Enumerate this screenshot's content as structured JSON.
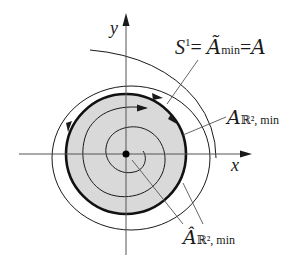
{
  "diagram": {
    "axes": {
      "x_label": "x",
      "y_label": "y"
    },
    "labels": {
      "circle_label": {
        "s": "S",
        "sup": "1",
        "eq1": "=",
        "a_tilde": "Ã",
        "min": "min",
        "eq2": "=",
        "a": "A"
      },
      "disk_label": {
        "a": "A",
        "sub": "ℝ², min"
      },
      "hat_label": {
        "a_hat": "Â",
        "sub": "ℝ², min"
      }
    },
    "colors": {
      "disk_fill": "#d9d9d9",
      "stroke": "#1a1a1a",
      "leader": "#555555"
    }
  }
}
